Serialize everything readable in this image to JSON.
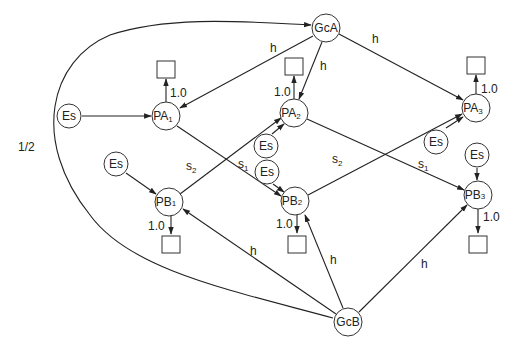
{
  "diagram": {
    "type": "directed-graph",
    "nodes": {
      "GcA": {
        "label": "GcA",
        "sub": ""
      },
      "GcB": {
        "label": "GcB",
        "sub": ""
      },
      "PA1": {
        "label": "PA",
        "sub": "1"
      },
      "PA2": {
        "label": "PA",
        "sub": "2"
      },
      "PA3": {
        "label": "PA",
        "sub": "3"
      },
      "PB1": {
        "label": "PB",
        "sub": "1"
      },
      "PB2": {
        "label": "PB",
        "sub": "2"
      },
      "PB3": {
        "label": "PB",
        "sub": "3"
      },
      "Es1": {
        "label": "Es"
      },
      "Es2": {
        "label": "Es"
      },
      "Es3": {
        "label": "Es"
      },
      "Es4": {
        "label": "Es"
      },
      "Es5": {
        "label": "Es"
      },
      "Es6": {
        "label": "Es"
      }
    },
    "edge_labels": {
      "h": "h",
      "s1_main": "s",
      "s1_sub": "1",
      "s2_main": "s",
      "s2_sub": "2",
      "one": "1.0",
      "half": "1/2"
    },
    "edges": [
      {
        "from": "GcB",
        "to": "GcA",
        "label": "1/2",
        "style": "curved-loop-left"
      },
      {
        "from": "GcA",
        "to": "PA1",
        "label": "h"
      },
      {
        "from": "GcA",
        "to": "PA2",
        "label": "h"
      },
      {
        "from": "GcA",
        "to": "PA3",
        "label": "h"
      },
      {
        "from": "GcB",
        "to": "PB1",
        "label": "h"
      },
      {
        "from": "GcB",
        "to": "PB2",
        "label": "h"
      },
      {
        "from": "GcB",
        "to": "PB3",
        "label": "h"
      },
      {
        "from": "PA1",
        "to": "PB2",
        "label": "s1"
      },
      {
        "from": "PB1",
        "to": "PA2",
        "label": "s2"
      },
      {
        "from": "PA2",
        "to": "PB3",
        "label": "s1"
      },
      {
        "from": "PB2",
        "to": "PA3",
        "label": "s2"
      },
      {
        "from": "Es1",
        "to": "PA1"
      },
      {
        "from": "Es2",
        "to": "PB1"
      },
      {
        "from": "Es3",
        "to": "PA2"
      },
      {
        "from": "Es4",
        "to": "PB2"
      },
      {
        "from": "Es5",
        "to": "PA3"
      },
      {
        "from": "Es6",
        "to": "PB3"
      },
      {
        "from": "PA1",
        "to": "sink",
        "label": "1.0"
      },
      {
        "from": "PA2",
        "to": "sink",
        "label": "1.0"
      },
      {
        "from": "PA3",
        "to": "sink",
        "label": "1.0"
      },
      {
        "from": "PB1",
        "to": "sink",
        "label": "1.0"
      },
      {
        "from": "PB2",
        "to": "sink",
        "label": "1.0"
      },
      {
        "from": "PB3",
        "to": "sink",
        "label": "1.0"
      }
    ]
  }
}
